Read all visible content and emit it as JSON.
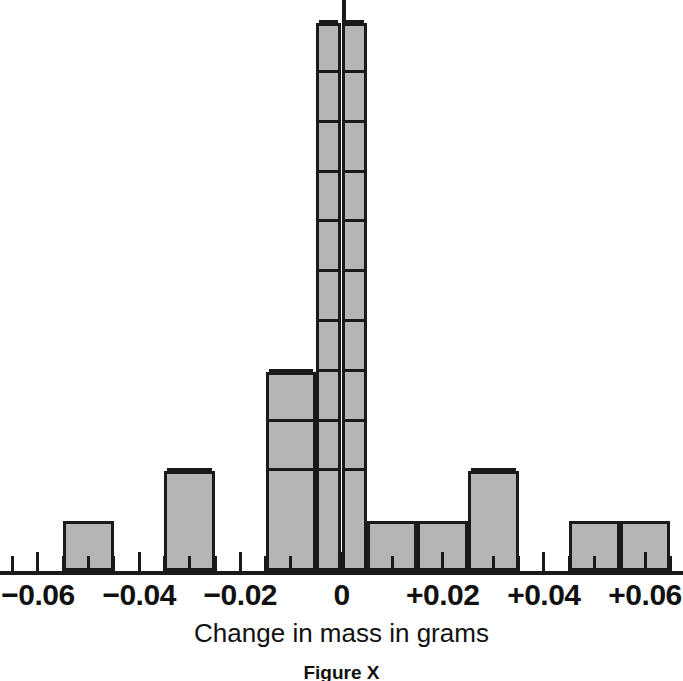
{
  "chart_data": {
    "type": "bar",
    "title": "",
    "subtitle": "",
    "xlabel": "Change in mass in grams",
    "ylabel": "",
    "caption": "Figure X",
    "grid": false,
    "legend": null,
    "xlim": [
      -0.0675,
      0.0675
    ],
    "ylim": [
      0,
      11
    ],
    "bin_width": 0.005,
    "tick_interval": 0.005,
    "tick_values": [
      -0.065,
      -0.06,
      -0.055,
      -0.05,
      -0.045,
      -0.04,
      -0.035,
      -0.03,
      -0.025,
      -0.02,
      -0.015,
      -0.01,
      -0.005,
      0,
      0.005,
      0.01,
      0.015,
      0.02,
      0.025,
      0.03,
      0.035,
      0.04,
      0.045,
      0.05,
      0.055,
      0.06,
      0.065
    ],
    "labeled_ticks": [
      {
        "value": -0.06,
        "label": "−0.06"
      },
      {
        "value": -0.04,
        "label": "−0.04"
      },
      {
        "value": -0.02,
        "label": "−0.02"
      },
      {
        "value": 0,
        "label": "0"
      },
      {
        "value": 0.02,
        "label": "+0.02"
      },
      {
        "value": 0.04,
        "label": "+0.04"
      },
      {
        "value": 0.06,
        "label": "+0.06"
      }
    ],
    "bars": [
      {
        "x_start": -0.055,
        "x_end": -0.045,
        "count": 1
      },
      {
        "x_start": -0.035,
        "x_end": -0.025,
        "count": 2
      },
      {
        "x_start": -0.015,
        "x_end": -0.005,
        "count": 4
      },
      {
        "x_start": -0.005,
        "x_end": 0.0,
        "count": 11
      },
      {
        "x_start": 0.0,
        "x_end": 0.005,
        "count": 11
      },
      {
        "x_start": 0.005,
        "x_end": 0.015,
        "count": 1
      },
      {
        "x_start": 0.015,
        "x_end": 0.025,
        "count": 1
      },
      {
        "x_start": 0.025,
        "x_end": 0.035,
        "count": 2
      },
      {
        "x_start": 0.045,
        "x_end": 0.055,
        "count": 1
      },
      {
        "x_start": 0.055,
        "x_end": 0.065,
        "count": 1
      }
    ],
    "colors": {
      "bar_fill": "#b5b5b5",
      "bar_stroke": "#1a1a1a",
      "axis": "#1a1a1a",
      "text": "#111111",
      "background": "#ffffff"
    }
  }
}
